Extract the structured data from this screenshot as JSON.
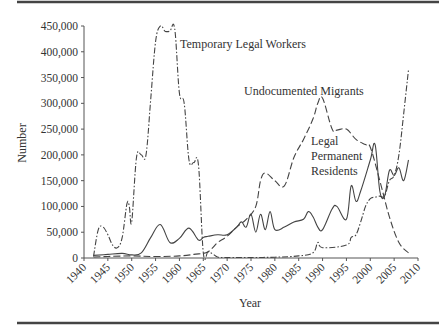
{
  "chart_data": {
    "type": "line",
    "title": "",
    "xlabel": "Year",
    "ylabel": "Number",
    "xlim": [
      1940,
      2010
    ],
    "ylim": [
      0,
      450000
    ],
    "grid": false,
    "legend": "none (series labeled by inline annotations)",
    "x_ticks": [
      "1940",
      "1945",
      "1950",
      "1955",
      "1960",
      "1965",
      "1970",
      "1975",
      "1980",
      "1985",
      "1990",
      "1995",
      "2000",
      "2005",
      "2010"
    ],
    "y_ticks": [
      "0",
      "50,000",
      "100,000",
      "150,000",
      "200,000",
      "250,000",
      "300,000",
      "350,000",
      "400,000",
      "450,000"
    ],
    "annotations": [
      {
        "text": "Temporary Legal Workers",
        "series": "Temporary Legal Workers"
      },
      {
        "text": "Undocumented Migrants",
        "series": "Undocumented Migrants"
      },
      {
        "text": "Legal Permanent Residents",
        "series": "Legal Permanent Residents"
      }
    ],
    "series": [
      {
        "name": "Temporary Legal Workers",
        "style": "dash-dot",
        "x": [
          1942,
          1943,
          1944,
          1945,
          1946,
          1947,
          1948,
          1949,
          1949.5,
          1950,
          1951,
          1952,
          1953,
          1954,
          1955,
          1956,
          1957,
          1958,
          1959,
          1960,
          1961,
          1962,
          1963,
          1964,
          1965,
          1966,
          1967,
          1968,
          1970,
          1975,
          1980,
          1985,
          1988,
          1989,
          1990,
          1995,
          1996,
          1997,
          1998,
          1999,
          2000,
          2001,
          2002,
          2003,
          2004,
          2005,
          2006,
          2007,
          2008
        ],
        "values": [
          3000,
          55000,
          60000,
          45000,
          25000,
          20000,
          40000,
          105000,
          100000,
          70000,
          195000,
          200000,
          200000,
          310000,
          420000,
          450000,
          440000,
          440000,
          445000,
          320000,
          300000,
          190000,
          185000,
          180000,
          10000,
          12000,
          8000,
          2000,
          1000,
          1000,
          1500,
          4000,
          10000,
          30000,
          20000,
          25000,
          40000,
          45000,
          70000,
          100000,
          115000,
          118000,
          120000,
          120000,
          150000,
          160000,
          200000,
          280000,
          365000
        ]
      },
      {
        "name": "Undocumented Migrants",
        "style": "dashed",
        "x": [
          1942,
          1945,
          1950,
          1955,
          1960,
          1963,
          1965,
          1966,
          1967,
          1968,
          1970,
          1972,
          1974,
          1976,
          1977,
          1978,
          1980,
          1982,
          1984,
          1986,
          1988,
          1989,
          1990,
          1992,
          1993,
          1995,
          1997,
          1999,
          2000,
          2002,
          2004,
          2006,
          2008
        ],
        "values": [
          2000,
          3000,
          4000,
          3000,
          4000,
          7000,
          9000,
          12000,
          20000,
          30000,
          42000,
          60000,
          75000,
          100000,
          150000,
          165000,
          150000,
          140000,
          195000,
          230000,
          270000,
          300000,
          310000,
          250000,
          248000,
          250000,
          230000,
          220000,
          215000,
          150000,
          80000,
          30000,
          10000
        ]
      },
      {
        "name": "Legal Permanent Residents",
        "style": "solid",
        "x": [
          1942,
          1945,
          1948,
          1950,
          1952,
          1954,
          1956,
          1958,
          1960,
          1962,
          1964,
          1965,
          1966,
          1968,
          1970,
          1972,
          1973,
          1974,
          1975,
          1976,
          1977,
          1978,
          1979,
          1980,
          1982,
          1984,
          1986,
          1987,
          1988,
          1989,
          1990,
          1992,
          1993,
          1995,
          1996,
          1997,
          1998,
          2000,
          2001,
          2002,
          2003,
          2004,
          2005,
          2006,
          2007,
          2008
        ],
        "values": [
          5000,
          7000,
          9000,
          6000,
          10000,
          40000,
          65000,
          30000,
          38000,
          58000,
          35000,
          40000,
          42000,
          45000,
          45000,
          60000,
          70000,
          60000,
          85000,
          50000,
          85000,
          55000,
          90000,
          55000,
          60000,
          70000,
          75000,
          90000,
          80000,
          60000,
          55000,
          95000,
          100000,
          75000,
          140000,
          110000,
          130000,
          190000,
          220000,
          130000,
          120000,
          170000,
          160000,
          175000,
          150000,
          190000
        ]
      }
    ]
  },
  "axes": {
    "xlabel": "Year",
    "ylabel": "Number",
    "x_ticks": [
      "1940",
      "1945",
      "1950",
      "1955",
      "1960",
      "1965",
      "1970",
      "1975",
      "1980",
      "1985",
      "1990",
      "1995",
      "2000",
      "2005",
      "2010"
    ],
    "y_ticks": [
      "0",
      "50,000",
      "100,000",
      "150,000",
      "200,000",
      "250,000",
      "300,000",
      "350,000",
      "400,000",
      "450,000"
    ]
  },
  "labels": {
    "temp": "Temporary Legal Workers",
    "undoc": "Undocumented Migrants",
    "lpr1": "Legal",
    "lpr2": "Permanent",
    "lpr3": "Residents"
  }
}
